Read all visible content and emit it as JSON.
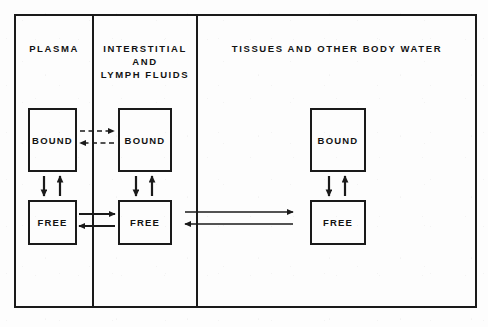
{
  "diagram": {
    "frame": {
      "border_color": "#1a1a1a",
      "background": "#fdfdfd"
    },
    "columns": [
      {
        "id": "plasma",
        "title": "PLASMA"
      },
      {
        "id": "interstitial",
        "title": "INTERSTITIAL AND\nLYMPH FLUIDS"
      },
      {
        "id": "tissues",
        "title": "TISSUES AND OTHER BODY WATER"
      }
    ],
    "boxes": [
      {
        "id": "plasma-bound",
        "column": "plasma",
        "label": "BOUND"
      },
      {
        "id": "plasma-free",
        "column": "plasma",
        "label": "FREE"
      },
      {
        "id": "inter-bound",
        "column": "interstitial",
        "label": "BOUND"
      },
      {
        "id": "inter-free",
        "column": "interstitial",
        "label": "FREE"
      },
      {
        "id": "tissue-bound",
        "column": "tissues",
        "label": "BOUND"
      },
      {
        "id": "tissue-free",
        "column": "tissues",
        "label": "FREE"
      }
    ],
    "connections": [
      {
        "id": "plasma-bound-to-inter-bound",
        "style": "dashed",
        "direction": "right",
        "from": "plasma-bound",
        "to": "inter-bound"
      },
      {
        "id": "inter-bound-to-plasma-bound",
        "style": "dashed",
        "direction": "left",
        "from": "inter-bound",
        "to": "plasma-bound"
      },
      {
        "id": "plasma-free-to-inter-free",
        "style": "solid",
        "direction": "right",
        "from": "plasma-free",
        "to": "inter-free"
      },
      {
        "id": "inter-free-to-plasma-free",
        "style": "solid",
        "direction": "left",
        "from": "inter-free",
        "to": "plasma-free"
      },
      {
        "id": "inter-free-to-tissue-free",
        "style": "solid",
        "direction": "right",
        "from": "inter-free",
        "to": "tissue-free"
      },
      {
        "id": "tissue-free-to-inter-free",
        "style": "solid",
        "direction": "left",
        "from": "tissue-free",
        "to": "inter-free"
      },
      {
        "id": "plasma-bound-to-free",
        "style": "solid",
        "direction": "down",
        "from": "plasma-bound",
        "to": "plasma-free"
      },
      {
        "id": "plasma-free-to-bound",
        "style": "solid",
        "direction": "up",
        "from": "plasma-free",
        "to": "plasma-bound"
      },
      {
        "id": "inter-bound-to-free",
        "style": "solid",
        "direction": "down",
        "from": "inter-bound",
        "to": "inter-free"
      },
      {
        "id": "inter-free-to-bound",
        "style": "solid",
        "direction": "up",
        "from": "inter-free",
        "to": "inter-bound"
      },
      {
        "id": "tissue-bound-to-free",
        "style": "solid",
        "direction": "down",
        "from": "tissue-bound",
        "to": "tissue-free"
      },
      {
        "id": "tissue-free-to-bound",
        "style": "solid",
        "direction": "up",
        "from": "tissue-free",
        "to": "tissue-bound"
      }
    ],
    "colors": {
      "ink": "#1a1a1a",
      "text": "#131313",
      "paper": "#fdfdfd"
    }
  }
}
